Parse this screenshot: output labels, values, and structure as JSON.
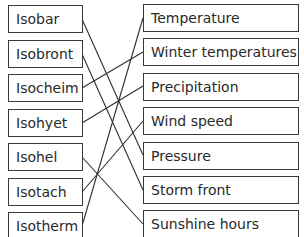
{
  "left_terms": [
    "Isobar",
    "Isobront",
    "Isocheim",
    "Isohyet",
    "Isohel",
    "Isotach",
    "Isotherm"
  ],
  "right_terms": [
    "Temperature",
    "Winter temperatures",
    "Precipitation",
    "Wind speed",
    "Pressure",
    "Storm front",
    "Sunshine hours"
  ],
  "connections": [
    {
      "from": "Isobar",
      "to": "Pressure"
    },
    {
      "from": "Isobront",
      "to": "Storm front"
    },
    {
      "from": "Isocheim",
      "to": "Winter temperatures"
    },
    {
      "from": "Isohyet",
      "to": "Precipitation"
    },
    {
      "from": "Isohel",
      "to": "Sunshine hours"
    },
    {
      "from": "Isotach",
      "to": "Wind speed"
    },
    {
      "from": "Isotherm",
      "to": "Temperature"
    }
  ],
  "colors": {
    "line": "#2f2f2f",
    "border": "#3a3a3a",
    "text": "#2a2a2a"
  }
}
